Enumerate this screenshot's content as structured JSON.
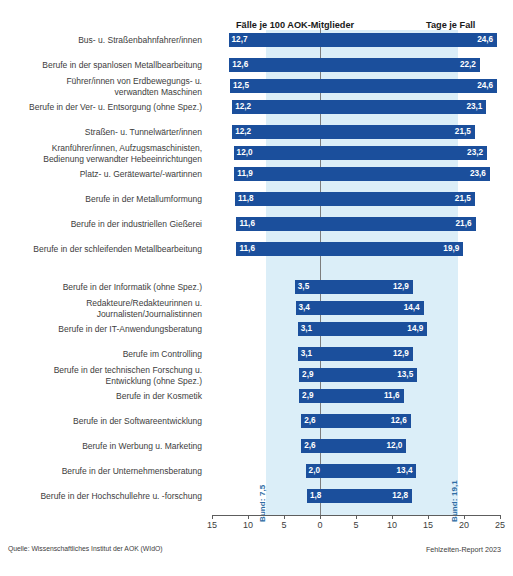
{
  "header": {
    "left_title": "Fälle je 100 AOK-Mitglieder",
    "right_title": "Tage je Fall"
  },
  "reference": {
    "left_label": "Bund: 7,5",
    "right_label": "Bund: 19,1",
    "left_value": 7.5,
    "right_value": 19.1
  },
  "footer": {
    "source": "Quelle: Wissenschaftliches Institut der AOK (WIdO)",
    "report": "Fehlzeiten-Report 2023"
  },
  "axis": {
    "tick_labels": [
      "15",
      "10",
      "5",
      "0",
      "5",
      "10",
      "15",
      "20",
      "25"
    ],
    "left_min": 0,
    "left_max": 15,
    "right_min": 0,
    "right_max": 25
  },
  "chart_data": {
    "type": "bar",
    "title": "",
    "subtitle": "",
    "xlabel": "",
    "ylabel": "",
    "orientation": "horizontal",
    "style": "bidirectional-paired-bar",
    "grid": false,
    "legend": "none",
    "left_axis": {
      "label": "Fälle je 100 AOK-Mitglieder",
      "range": [
        15,
        0
      ],
      "ticks": [
        15,
        10,
        5,
        0
      ]
    },
    "right_axis": {
      "label": "Tage je Fall",
      "range": [
        0,
        25
      ],
      "ticks": [
        0,
        5,
        10,
        15,
        20,
        25
      ]
    },
    "reference_lines": [
      {
        "name": "Bund: 7,5",
        "axis": "left",
        "value": 7.5
      },
      {
        "name": "Bund: 19,1",
        "axis": "right",
        "value": 19.1
      }
    ],
    "categories": [
      "Bus- u. Straßenbahnfahrer/innen",
      "Berufe in der spanlosen Metallbearbeitung",
      "Führer/innen von Erdbewegungs- u. verwandten Maschinen",
      "Berufe in der Ver- u. Entsorgung (ohne Spez.)",
      "Straßen- u. Tunnelwärter/innen",
      "Kranführer/innen, Aufzugsmaschinisten, Bedienung verwandter Hebeeinrichtungen",
      "Platz- u. Gerätewarte/-wartinnen",
      "Berufe in der Metallumformung",
      "Berufe in der industriellen Gießerei",
      "Berufe in der schleifenden Metallbearbeitung",
      "Berufe in der Informatik (ohne Spez.)",
      "Redakteure/Redakteurinnen u. Journalisten/Journalistinnen",
      "Berufe in der IT-Anwendungsberatung",
      "Berufe im Controlling",
      "Berufe in der technischen Forschung u. Entwicklung (ohne Spez.)",
      "Berufe in der Kosmetik",
      "Berufe in der Softwareentwicklung",
      "Berufe in Werbung u. Marketing",
      "Berufe in der Unternehmensberatung",
      "Berufe in der Hochschullehre u. -forschung"
    ],
    "series": [
      {
        "name": "Fälle je 100 AOK-Mitglieder",
        "values": [
          12.7,
          12.6,
          12.5,
          12.2,
          12.2,
          12.0,
          11.9,
          11.8,
          11.6,
          11.6,
          3.5,
          3.4,
          3.1,
          3.1,
          2.9,
          2.9,
          2.6,
          2.6,
          2.0,
          1.8
        ]
      },
      {
        "name": "Tage je Fall",
        "values": [
          24.6,
          22.2,
          24.6,
          23.1,
          21.5,
          23.2,
          23.6,
          21.5,
          21.6,
          19.9,
          12.9,
          14.4,
          14.9,
          12.9,
          13.5,
          11.6,
          12.6,
          12.0,
          13.4,
          12.8
        ]
      }
    ]
  },
  "rows": [
    {
      "label": "Bus- u. Straßenbahnfahrer/innen",
      "left": "12,7",
      "right": "24,6",
      "left_value": 12.7,
      "right_value": 24.6,
      "group": "top",
      "lines": 1
    },
    {
      "label": "Berufe in der spanlosen Metallbearbeitung",
      "left": "12,6",
      "right": "22,2",
      "left_value": 12.6,
      "right_value": 22.2,
      "group": "top",
      "lines": 1
    },
    {
      "label": "Führer/innen von Erdbewegungs- u.\nverwandten Maschinen",
      "left": "12,5",
      "right": "24,6",
      "left_value": 12.5,
      "right_value": 24.6,
      "group": "top",
      "lines": 2
    },
    {
      "label": "Berufe in der Ver- u. Entsorgung (ohne Spez.)",
      "left": "12,2",
      "right": "23,1",
      "left_value": 12.2,
      "right_value": 23.1,
      "group": "top",
      "lines": 1
    },
    {
      "label": "Straßen- u. Tunnelwärter/innen",
      "left": "12,2",
      "right": "21,5",
      "left_value": 12.2,
      "right_value": 21.5,
      "group": "top",
      "lines": 1
    },
    {
      "label": "Kranführer/innen, Aufzugsmaschinisten,\nBedienung verwandter Hebeeinrichtungen",
      "left": "12,0",
      "right": "23,2",
      "left_value": 12.0,
      "right_value": 23.2,
      "group": "top",
      "lines": 2
    },
    {
      "label": "Platz- u. Gerätewarte/-wartinnen",
      "left": "11,9",
      "right": "23,6",
      "left_value": 11.9,
      "right_value": 23.6,
      "group": "top",
      "lines": 1
    },
    {
      "label": "Berufe in der Metallumformung",
      "left": "11,8",
      "right": "21,5",
      "left_value": 11.8,
      "right_value": 21.5,
      "group": "top",
      "lines": 1
    },
    {
      "label": "Berufe in der industriellen Gießerei",
      "left": "11,6",
      "right": "21,6",
      "left_value": 11.6,
      "right_value": 21.6,
      "group": "top",
      "lines": 1
    },
    {
      "label": "Berufe in der schleifenden Metallbearbeitung",
      "left": "11,6",
      "right": "19,9",
      "left_value": 11.6,
      "right_value": 19.9,
      "group": "top",
      "lines": 1
    },
    {
      "label": "Berufe in der Informatik (ohne Spez.)",
      "left": "3,5",
      "right": "12,9",
      "left_value": 3.5,
      "right_value": 12.9,
      "group": "bottom",
      "lines": 1
    },
    {
      "label": "Redakteure/Redakteurinnen u.\nJournalisten/Journalistinnen",
      "left": "3,4",
      "right": "14,4",
      "left_value": 3.4,
      "right_value": 14.4,
      "group": "bottom",
      "lines": 2
    },
    {
      "label": "Berufe in der IT-Anwendungsberatung",
      "left": "3,1",
      "right": "14,9",
      "left_value": 3.1,
      "right_value": 14.9,
      "group": "bottom",
      "lines": 1
    },
    {
      "label": "Berufe im Controlling",
      "left": "3,1",
      "right": "12,9",
      "left_value": 3.1,
      "right_value": 12.9,
      "group": "bottom",
      "lines": 1
    },
    {
      "label": "Berufe in der technischen Forschung u.\nEntwicklung (ohne Spez.)",
      "left": "2,9",
      "right": "13,5",
      "left_value": 2.9,
      "right_value": 13.5,
      "group": "bottom",
      "lines": 2
    },
    {
      "label": "Berufe in der Kosmetik",
      "left": "2,9",
      "right": "11,6",
      "left_value": 2.9,
      "right_value": 11.6,
      "group": "bottom",
      "lines": 1
    },
    {
      "label": "Berufe in der Softwareentwicklung",
      "left": "2,6",
      "right": "12,6",
      "left_value": 2.6,
      "right_value": 12.6,
      "group": "bottom",
      "lines": 1
    },
    {
      "label": "Berufe in Werbung u. Marketing",
      "left": "2,6",
      "right": "12,0",
      "left_value": 2.6,
      "right_value": 12.0,
      "group": "bottom",
      "lines": 1
    },
    {
      "label": "Berufe in der Unternehmensberatung",
      "left": "2,0",
      "right": "13,4",
      "left_value": 2.0,
      "right_value": 13.4,
      "group": "bottom",
      "lines": 1
    },
    {
      "label": "Berufe in der Hochschullehre u. -forschung",
      "left": "1,8",
      "right": "12,8",
      "left_value": 1.8,
      "right_value": 12.8,
      "group": "bottom",
      "lines": 1
    }
  ],
  "colors": {
    "bar": "#1b4f9c",
    "band": "#dbeef8",
    "zero_line": "#7d7d7d",
    "text": "#3c3c3c",
    "bund_label": "#2e6da4"
  }
}
